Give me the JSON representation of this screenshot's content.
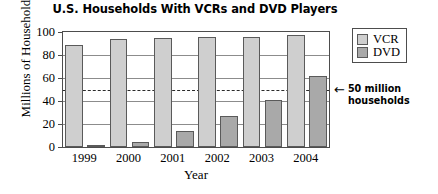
{
  "chart_data": {
    "type": "bar",
    "title": "U.S. Households With VCRs and DVD Players",
    "xlabel": "Year",
    "ylabel": "Millions of Households",
    "categories": [
      "1999",
      "2000",
      "2001",
      "2002",
      "2003",
      "2004"
    ],
    "series": [
      {
        "name": "VCR",
        "color": "#cfcfcf",
        "values": [
          89,
          94,
          95,
          96,
          96,
          97
        ]
      },
      {
        "name": "DVD",
        "color": "#a9a9a9",
        "values": [
          2,
          4,
          14,
          27,
          41,
          62
        ]
      }
    ],
    "ylim": [
      0,
      100
    ],
    "yticks": [
      0,
      20,
      40,
      60,
      80,
      100
    ],
    "ytick_labels": [
      "0",
      "20",
      "40",
      "60",
      "80",
      "100"
    ],
    "grid": true,
    "legend_position": "right-top",
    "legend_entries": [
      "VCR",
      "DVD"
    ],
    "annotations": [
      {
        "value": 50,
        "style": "dashed-reference-line",
        "arrow": "←",
        "line1": "50 million",
        "line2": "households"
      }
    ]
  }
}
